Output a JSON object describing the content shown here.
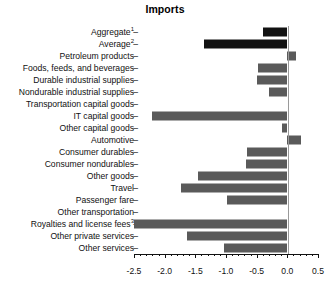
{
  "chart_data": {
    "type": "bar",
    "orientation": "horizontal",
    "title": "Imports",
    "xlabel": "",
    "ylabel": "",
    "xlim": [
      -2.5,
      0.5
    ],
    "xticks": [
      -2.5,
      -2.0,
      -1.5,
      -1.0,
      -0.5,
      0.0,
      0.5
    ],
    "xticklabels": [
      "-2.5",
      "-2.0",
      "-1.5",
      "-1.0",
      "-0.5",
      "0.0",
      "0.5"
    ],
    "minor_tick_step": 0.1,
    "grid": false,
    "legend": null,
    "zero_line": 0.0,
    "colors": {
      "aggregate_bar": "#121212",
      "average_bar": "#121212",
      "category_bar": "#5a5a5a",
      "axis": "#111111",
      "zero_line": "#9a9a9a",
      "background": "#ffffff"
    },
    "categories": [
      "Aggregate",
      "Average",
      "Petroleum products",
      "Foods, feeds, and beverages",
      "Durable industrial supplies",
      "Nondurable industrial supplies",
      "Transportation capital goods",
      "IT capital goods",
      "Other capital goods",
      "Automotive",
      "Consumer durables",
      "Consumer nondurables",
      "Other goods",
      "Travel",
      "Passenger fare",
      "Other transportation",
      "Royalties and license fees",
      "Other private services",
      "Other services"
    ],
    "values": [
      -0.4,
      -1.36,
      0.14,
      -0.48,
      -0.5,
      -0.3,
      0.0,
      -2.2,
      -0.09,
      0.23,
      -0.66,
      -0.67,
      -1.46,
      -1.73,
      -0.98,
      0.0,
      -2.5,
      -1.63,
      -1.03
    ],
    "footnote_markers": {
      "Aggregate": "1",
      "Average": "2",
      "Royalties and license fees": "3"
    }
  },
  "rows": [
    {
      "label": "Aggregate",
      "sup": "1",
      "value": -0.4,
      "dark": true
    },
    {
      "label": "Average",
      "sup": "2",
      "value": -1.36,
      "dark": true
    },
    {
      "label": "Petroleum products",
      "sup": "",
      "value": 0.14,
      "dark": false
    },
    {
      "label": "Foods, feeds, and beverages",
      "sup": "",
      "value": -0.48,
      "dark": false
    },
    {
      "label": "Durable industrial supplies",
      "sup": "",
      "value": -0.5,
      "dark": false
    },
    {
      "label": "Nondurable industrial supplies",
      "sup": "",
      "value": -0.3,
      "dark": false
    },
    {
      "label": "Transportation capital goods",
      "sup": "",
      "value": 0.0,
      "dark": false
    },
    {
      "label": "IT capital goods",
      "sup": "",
      "value": -2.2,
      "dark": false
    },
    {
      "label": "Other capital goods",
      "sup": "",
      "value": -0.09,
      "dark": false
    },
    {
      "label": "Automotive",
      "sup": "",
      "value": 0.23,
      "dark": false
    },
    {
      "label": "Consumer durables",
      "sup": "",
      "value": -0.66,
      "dark": false
    },
    {
      "label": "Consumer nondurables",
      "sup": "",
      "value": -0.67,
      "dark": false
    },
    {
      "label": "Other goods",
      "sup": "",
      "value": -1.46,
      "dark": false
    },
    {
      "label": "Travel",
      "sup": "",
      "value": -1.73,
      "dark": false
    },
    {
      "label": "Passenger fare",
      "sup": "",
      "value": -0.98,
      "dark": false
    },
    {
      "label": "Other transportation",
      "sup": "",
      "value": 0.0,
      "dark": false
    },
    {
      "label": "Royalties and license fees",
      "sup": "3",
      "value": -2.5,
      "dark": false
    },
    {
      "label": "Other private services",
      "sup": "",
      "value": -1.63,
      "dark": false
    },
    {
      "label": "Other services",
      "sup": "",
      "value": -1.03,
      "dark": false
    }
  ],
  "axis": {
    "tick_dash": "–"
  }
}
